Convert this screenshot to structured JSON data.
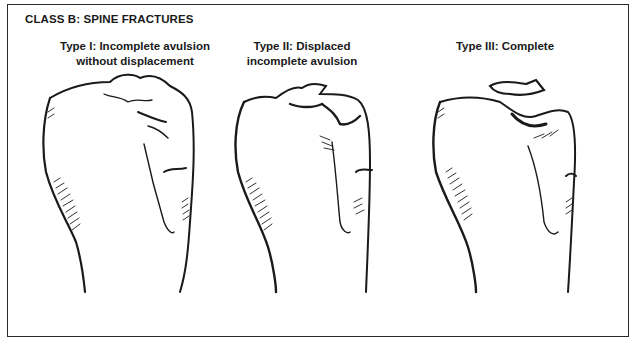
{
  "diagram": {
    "title": "CLASS B: SPINE FRACTURES",
    "panels": [
      {
        "label": "Type I: Incomplete avulsion\nwithout displacement",
        "illustration": "tibia-incomplete-avulsion"
      },
      {
        "label": "Type II: Displaced\nincomplete avulsion",
        "illustration": "tibia-displaced-avulsion"
      },
      {
        "label": "Type III: Complete",
        "illustration": "tibia-complete-avulsion"
      }
    ]
  },
  "colors": {
    "ink": "#1a1a1a",
    "background": "#ffffff",
    "border": "#2a2a2a"
  }
}
